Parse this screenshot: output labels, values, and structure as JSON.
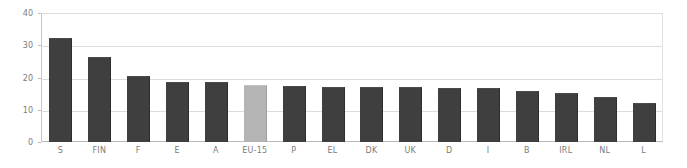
{
  "chart_data": {
    "type": "bar",
    "title": "",
    "xlabel": "",
    "ylabel": "",
    "ylim": [
      0,
      40
    ],
    "yticks": [
      0,
      10,
      20,
      30,
      40
    ],
    "grid": true,
    "legend": false,
    "categories": [
      "S",
      "FIN",
      "F",
      "E",
      "A",
      "EU-15",
      "P",
      "EL",
      "DK",
      "UK",
      "D",
      "I",
      "B",
      "IRL",
      "NL",
      "L"
    ],
    "values": [
      31.8,
      26.2,
      20.2,
      18.3,
      18.2,
      17.4,
      17.2,
      16.9,
      16.8,
      16.6,
      16.5,
      16.3,
      15.6,
      14.9,
      13.8,
      11.9
    ],
    "series": [
      {
        "name": "value",
        "values": [
          31.8,
          26.2,
          20.2,
          18.3,
          18.2,
          17.4,
          17.2,
          16.9,
          16.8,
          16.6,
          16.5,
          16.3,
          15.6,
          14.9,
          13.8,
          11.9
        ]
      }
    ],
    "highlight_category": "EU-15",
    "colors": {
      "bar": "#3f3f3f",
      "highlight_bar": "#b4b4b4",
      "gridline": "#dcdcdc",
      "axis": "#b9b9b9",
      "tick_text": "#7c7c7c",
      "background": "#ffffff"
    }
  }
}
